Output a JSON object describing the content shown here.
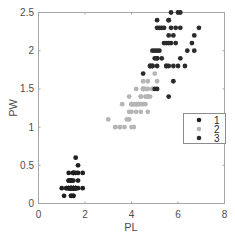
{
  "chart_data": {
    "type": "scatter",
    "title": "",
    "xlabel": "PL",
    "ylabel": "PW",
    "xlim": [
      0,
      8
    ],
    "ylim": [
      0,
      2.5
    ],
    "xticks": [
      "0",
      "2",
      "4",
      "6",
      "8"
    ],
    "yticks": [
      "0",
      "0.5",
      "1",
      "1.5",
      "2",
      "2.5"
    ],
    "grid": false,
    "legend_position": "right-middle inside",
    "series": [
      {
        "name": "1",
        "color": "#1f1f1f",
        "points": [
          [
            1.4,
            0.2
          ],
          [
            1.4,
            0.2
          ],
          [
            1.3,
            0.2
          ],
          [
            1.5,
            0.2
          ],
          [
            1.4,
            0.2
          ],
          [
            1.7,
            0.4
          ],
          [
            1.4,
            0.3
          ],
          [
            1.5,
            0.2
          ],
          [
            1.4,
            0.2
          ],
          [
            1.5,
            0.1
          ],
          [
            1.5,
            0.2
          ],
          [
            1.6,
            0.2
          ],
          [
            1.4,
            0.1
          ],
          [
            1.1,
            0.1
          ],
          [
            1.2,
            0.2
          ],
          [
            1.5,
            0.4
          ],
          [
            1.3,
            0.4
          ],
          [
            1.4,
            0.3
          ],
          [
            1.7,
            0.3
          ],
          [
            1.5,
            0.3
          ],
          [
            1.7,
            0.2
          ],
          [
            1.5,
            0.4
          ],
          [
            1.0,
            0.2
          ],
          [
            1.7,
            0.5
          ],
          [
            1.9,
            0.2
          ],
          [
            1.6,
            0.2
          ],
          [
            1.6,
            0.4
          ],
          [
            1.5,
            0.2
          ],
          [
            1.4,
            0.2
          ],
          [
            1.6,
            0.2
          ],
          [
            1.6,
            0.2
          ],
          [
            1.5,
            0.4
          ],
          [
            1.5,
            0.1
          ],
          [
            1.4,
            0.2
          ],
          [
            1.5,
            0.2
          ],
          [
            1.2,
            0.2
          ],
          [
            1.3,
            0.2
          ],
          [
            1.4,
            0.1
          ],
          [
            1.3,
            0.2
          ],
          [
            1.5,
            0.2
          ],
          [
            1.3,
            0.3
          ],
          [
            1.3,
            0.3
          ],
          [
            1.3,
            0.2
          ],
          [
            1.6,
            0.6
          ],
          [
            1.9,
            0.4
          ],
          [
            1.4,
            0.3
          ],
          [
            1.6,
            0.2
          ],
          [
            1.4,
            0.2
          ],
          [
            1.5,
            0.2
          ],
          [
            1.4,
            0.2
          ]
        ]
      },
      {
        "name": "2",
        "color": "#b5b5b5",
        "points": [
          [
            4.7,
            1.4
          ],
          [
            4.5,
            1.5
          ],
          [
            4.9,
            1.5
          ],
          [
            4.0,
            1.3
          ],
          [
            4.6,
            1.5
          ],
          [
            4.5,
            1.3
          ],
          [
            4.7,
            1.6
          ],
          [
            3.3,
            1.0
          ],
          [
            4.6,
            1.3
          ],
          [
            3.9,
            1.4
          ],
          [
            3.5,
            1.0
          ],
          [
            4.2,
            1.5
          ],
          [
            4.0,
            1.0
          ],
          [
            4.7,
            1.4
          ],
          [
            3.6,
            1.3
          ],
          [
            4.4,
            1.4
          ],
          [
            4.5,
            1.5
          ],
          [
            4.1,
            1.0
          ],
          [
            4.5,
            1.5
          ],
          [
            3.9,
            1.1
          ],
          [
            4.8,
            1.8
          ],
          [
            4.0,
            1.3
          ],
          [
            4.9,
            1.5
          ],
          [
            4.7,
            1.2
          ],
          [
            4.3,
            1.3
          ],
          [
            4.4,
            1.4
          ],
          [
            4.8,
            1.4
          ],
          [
            5.0,
            1.7
          ],
          [
            4.5,
            1.5
          ],
          [
            3.5,
            1.0
          ],
          [
            3.8,
            1.1
          ],
          [
            3.7,
            1.0
          ],
          [
            3.9,
            1.2
          ],
          [
            5.1,
            1.6
          ],
          [
            4.5,
            1.5
          ],
          [
            4.5,
            1.6
          ],
          [
            4.7,
            1.5
          ],
          [
            4.4,
            1.3
          ],
          [
            4.1,
            1.3
          ],
          [
            4.0,
            1.3
          ],
          [
            4.4,
            1.2
          ],
          [
            4.6,
            1.4
          ],
          [
            4.0,
            1.2
          ],
          [
            3.3,
            1.0
          ],
          [
            4.2,
            1.3
          ],
          [
            4.2,
            1.2
          ],
          [
            4.2,
            1.3
          ],
          [
            4.3,
            1.3
          ],
          [
            3.0,
            1.1
          ],
          [
            4.1,
            1.3
          ]
        ]
      },
      {
        "name": "3",
        "color": "#2b2b2b",
        "points": [
          [
            6.0,
            2.5
          ],
          [
            5.1,
            1.9
          ],
          [
            5.9,
            2.1
          ],
          [
            5.6,
            1.8
          ],
          [
            5.8,
            2.2
          ],
          [
            6.6,
            2.1
          ],
          [
            4.5,
            1.7
          ],
          [
            6.3,
            1.8
          ],
          [
            5.8,
            1.8
          ],
          [
            6.1,
            2.5
          ],
          [
            5.1,
            2.0
          ],
          [
            5.3,
            1.9
          ],
          [
            5.5,
            2.1
          ],
          [
            5.0,
            2.0
          ],
          [
            5.1,
            2.4
          ],
          [
            5.3,
            2.3
          ],
          [
            5.5,
            1.8
          ],
          [
            6.7,
            2.2
          ],
          [
            6.9,
            2.3
          ],
          [
            5.0,
            1.5
          ],
          [
            5.7,
            2.3
          ],
          [
            4.9,
            2.0
          ],
          [
            6.7,
            2.0
          ],
          [
            4.9,
            1.8
          ],
          [
            5.7,
            2.1
          ],
          [
            6.0,
            1.8
          ],
          [
            4.8,
            1.8
          ],
          [
            4.9,
            1.8
          ],
          [
            5.6,
            2.1
          ],
          [
            5.8,
            1.6
          ],
          [
            6.1,
            1.9
          ],
          [
            6.4,
            2.0
          ],
          [
            5.6,
            2.2
          ],
          [
            5.1,
            1.5
          ],
          [
            5.6,
            1.4
          ],
          [
            6.1,
            2.3
          ],
          [
            5.6,
            2.4
          ],
          [
            5.5,
            1.8
          ],
          [
            4.8,
            1.8
          ],
          [
            5.4,
            2.1
          ],
          [
            5.6,
            2.4
          ],
          [
            5.1,
            2.3
          ],
          [
            5.1,
            1.9
          ],
          [
            5.9,
            2.3
          ],
          [
            5.7,
            2.5
          ],
          [
            5.2,
            2.3
          ],
          [
            5.0,
            1.9
          ],
          [
            5.2,
            2.0
          ],
          [
            5.4,
            2.3
          ],
          [
            5.1,
            1.8
          ]
        ]
      }
    ]
  },
  "legend": {
    "entries": [
      {
        "label": "1",
        "color": "#1f1f1f"
      },
      {
        "label": "2",
        "color": "#b5b5b5"
      },
      {
        "label": "3",
        "color": "#2b2b2b"
      }
    ]
  },
  "axes": {
    "x_label": "PL",
    "y_label": "PW",
    "x_ticks": [
      "0",
      "2",
      "4",
      "6",
      "8"
    ],
    "y_ticks": [
      "0",
      "0.5",
      "1",
      "1.5",
      "2",
      "2.5"
    ]
  }
}
